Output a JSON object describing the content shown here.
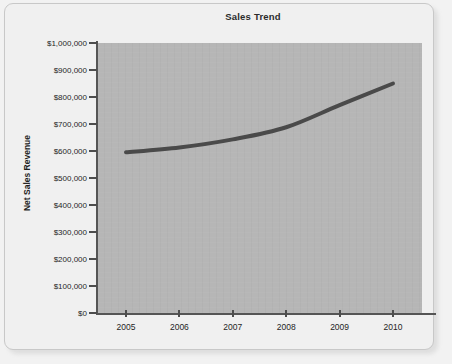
{
  "card": {
    "name": "chart-card"
  },
  "chart_data": {
    "type": "line",
    "title": "Sales Trend",
    "xlabel": "",
    "ylabel": "Net Sales Revenue",
    "categories": [
      "2005",
      "2006",
      "2007",
      "2008",
      "2009",
      "2010"
    ],
    "values": [
      595000,
      613000,
      643000,
      688000,
      770000,
      850000
    ],
    "series": [
      {
        "name": "Net Sales Revenue",
        "values": [
          595000,
          613000,
          643000,
          688000,
          770000,
          850000
        ]
      }
    ],
    "ylim": [
      0,
      1000000
    ],
    "ytick_values": [
      0,
      100000,
      200000,
      300000,
      400000,
      500000,
      600000,
      700000,
      800000,
      900000,
      1000000
    ],
    "ytick_labels": [
      "$0",
      "$100,000",
      "$200,000",
      "$300,000",
      "$400,000",
      "$500,000",
      "$600,000",
      "$700,000",
      "$800,000",
      "$900,000",
      "$1,000,000"
    ],
    "xtick_labels": [
      "2005",
      "2006",
      "2007",
      "2008",
      "2009",
      "2010"
    ],
    "grid": false,
    "legend": false,
    "legend_position": "none",
    "colors": {
      "line": "#4a4a4a",
      "plot_background": "#b6b6b6",
      "card_background": "#f0f0f0",
      "axis": "#555555",
      "text": "#1f1f1f"
    }
  }
}
